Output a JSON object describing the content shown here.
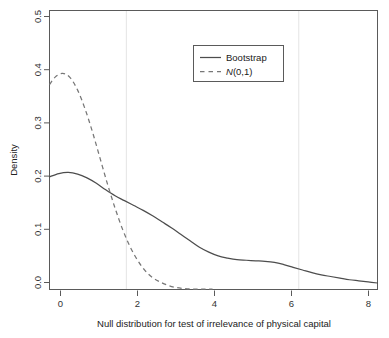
{
  "chart_data": {
    "type": "line",
    "title": "",
    "xlabel": "Null distribution for test of irrelevance of physical capital",
    "ylabel": "Density",
    "xlim": [
      -0.35,
      8.4
    ],
    "ylim": [
      0.0,
      0.515
    ],
    "grid": false,
    "xticks": [
      0,
      2,
      4,
      6,
      8
    ],
    "xtick_labels": [
      "0",
      "2",
      "4",
      "6",
      "8"
    ],
    "yticks": [
      0.0,
      0.1,
      0.2,
      0.3,
      0.4,
      0.5
    ],
    "ytick_labels": [
      "0.0",
      "0.1",
      "0.2",
      "0.3",
      "0.4",
      "0.5"
    ],
    "legend_position": "top-center-right",
    "annotations": {
      "vertical_reference_lines": [
        1.7,
        6.3
      ]
    },
    "series": [
      {
        "name": "Bootstrap",
        "style": "solid",
        "color": "#4d4d4d",
        "x": [
          -0.35,
          -0.1,
          0.15,
          0.4,
          0.65,
          0.9,
          1.15,
          1.4,
          1.65,
          1.9,
          2.15,
          2.4,
          2.65,
          2.9,
          3.15,
          3.4,
          3.65,
          3.9,
          4.15,
          4.4,
          4.65,
          4.9,
          5.15,
          5.4,
          5.65,
          5.9,
          6.15,
          6.4,
          6.65,
          6.9,
          7.15,
          7.4,
          7.65,
          7.9,
          8.15,
          8.4
        ],
        "y": [
          0.208,
          0.214,
          0.216,
          0.213,
          0.206,
          0.196,
          0.184,
          0.173,
          0.164,
          0.155,
          0.146,
          0.136,
          0.125,
          0.114,
          0.102,
          0.09,
          0.078,
          0.069,
          0.062,
          0.058,
          0.055,
          0.054,
          0.053,
          0.052,
          0.05,
          0.046,
          0.041,
          0.036,
          0.031,
          0.027,
          0.024,
          0.021,
          0.018,
          0.016,
          0.014,
          0.012
        ]
      },
      {
        "name": "N(0,1)",
        "style": "dashed",
        "color": "#777777",
        "x": [
          -0.35,
          -0.2,
          0.0,
          0.2,
          0.4,
          0.6,
          0.8,
          1.0,
          1.2,
          1.4,
          1.6,
          1.8,
          2.0,
          2.2,
          2.4,
          2.6,
          2.8,
          3.0,
          3.2,
          3.4,
          3.6,
          3.8,
          4.0
        ],
        "y": [
          0.378,
          0.392,
          0.399,
          0.391,
          0.368,
          0.333,
          0.29,
          0.242,
          0.194,
          0.15,
          0.111,
          0.079,
          0.054,
          0.035,
          0.022,
          0.014,
          0.008,
          0.004,
          0.002,
          0.001,
          0.0008,
          0.0005,
          0.0005
        ]
      }
    ],
    "legend": [
      {
        "label": "Bootstrap",
        "style": "solid",
        "italic_first_char": false
      },
      {
        "label": "N(0,1)",
        "style": "dashed",
        "italic_first_char": true,
        "italic_part": "N",
        "rest_part": "(0,1)"
      }
    ]
  },
  "colors": {
    "bootstrap_line": "#4d4d4d",
    "normal_line": "#777777",
    "axis": "#555555",
    "reference_line": "#dedede",
    "legend_border": "#555555",
    "background": "#ffffff"
  }
}
